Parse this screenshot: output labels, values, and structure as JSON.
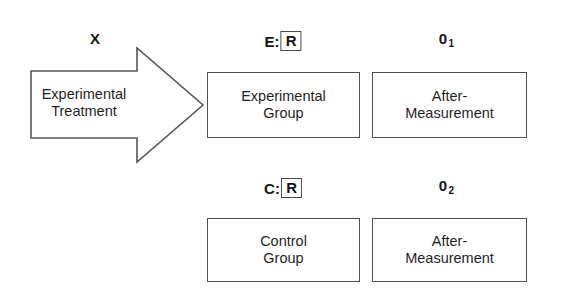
{
  "diagram": {
    "background_color": "#ffffff",
    "line_color": "#4f4f4f",
    "text_color": "#1f1f1f",
    "treatment": {
      "label": "X",
      "arrow_name": "experimental-treatment-arrow",
      "caption": "Experimental\nTreatment"
    },
    "rows": [
      {
        "assignment": {
          "prefix": "E:",
          "boxed": "R"
        },
        "observation": {
          "symbol": "0",
          "subscript": "1"
        },
        "group_box": "Experimental\nGroup",
        "measure_box": "After-\nMeasurement"
      },
      {
        "assignment": {
          "prefix": "C:",
          "boxed": "R"
        },
        "observation": {
          "symbol": "0",
          "subscript": "2"
        },
        "group_box": "Control\nGroup",
        "measure_box": "After-\nMeasurement"
      }
    ]
  }
}
